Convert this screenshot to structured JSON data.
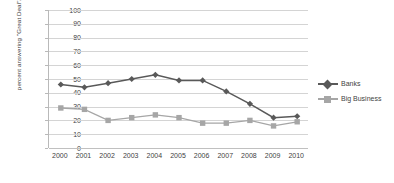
{
  "chart_data": {
    "type": "line",
    "title": "",
    "xlabel": "",
    "ylabel": "percent answering \"Great Deal\"/\"Quite a lot\"",
    "categories": [
      "2000",
      "2001",
      "2002",
      "2003",
      "2004",
      "2005",
      "2006",
      "2007",
      "2008",
      "2009",
      "2010"
    ],
    "ylim": [
      0,
      100
    ],
    "yticks": [
      0,
      10,
      20,
      30,
      40,
      50,
      60,
      70,
      80,
      90,
      100
    ],
    "grid": true,
    "legend_position": "right",
    "series": [
      {
        "name": "Banks",
        "color": "#595959",
        "marker": "diamond",
        "values": [
          46,
          44,
          47,
          50,
          53,
          49,
          49,
          41,
          32,
          22,
          23
        ]
      },
      {
        "name": "Big Business",
        "color": "#a6a6a6",
        "marker": "square",
        "values": [
          29,
          28,
          20,
          22,
          24,
          22,
          18,
          18,
          20,
          16,
          19
        ]
      }
    ]
  }
}
